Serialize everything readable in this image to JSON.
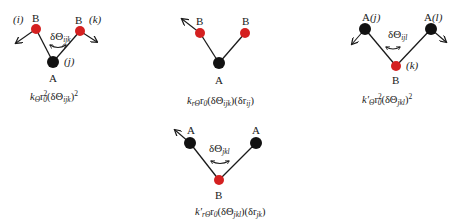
{
  "colors": {
    "atom_A": "#111111",
    "atom_B": "#d42020",
    "bond": "#1a1a1a"
  },
  "panels": [
    {
      "id": "bend-ijk",
      "labels": {
        "left_index": "(i)",
        "left_atom": "B",
        "right_atom": "B",
        "right_index": "(k)",
        "center_index": "(j)",
        "center_atom": "A",
        "angle": "δΘ",
        "angle_sub": "ijk"
      },
      "formula": {
        "k": "k",
        "k_sub": "Θ",
        "r": "r",
        "r_sup": "2",
        "r_sub": "0",
        "body": "(δΘ",
        "body_sub": "ijk",
        "tail": ")",
        "tail_sup": "2"
      }
    },
    {
      "id": "stretch-bend",
      "labels": {
        "left_atom": "B",
        "right_atom": "B",
        "center_atom": "A"
      },
      "formula": {
        "k": "k",
        "k_sub": "rΘ",
        "r": "r",
        "r_sub": "0",
        "body": "(δΘ",
        "body_sub": "ijk",
        "mid": ")(δr",
        "mid_sub": "ij",
        "tail": ")"
      }
    },
    {
      "id": "bend-jkl",
      "labels": {
        "left_atom": "A",
        "left_index": "(j)",
        "right_atom": "A",
        "right_index": "(l)",
        "center_atom": "B",
        "center_index": "(k)",
        "angle": "δΘ",
        "angle_sub": "ijl"
      },
      "formula": {
        "k": "k′",
        "k_sub": "Θ",
        "r": "r",
        "r_sup": "2",
        "r_sub": "0",
        "body": "(δΘ",
        "body_sub": "jkl",
        "tail": ")",
        "tail_sup": "2"
      }
    },
    {
      "id": "stretch-bend-prime",
      "labels": {
        "left_atom": "A",
        "right_atom": "A",
        "center_atom": "B",
        "angle": "δΘ",
        "angle_sub": "jkl"
      },
      "formula": {
        "k": "k′",
        "k_sub": "rΘ",
        "r": "r",
        "r_sub": "0",
        "body": "(δΘ",
        "body_sub": "jkl",
        "mid": ")(δr",
        "mid_sub": "jk",
        "tail": ")"
      }
    }
  ]
}
